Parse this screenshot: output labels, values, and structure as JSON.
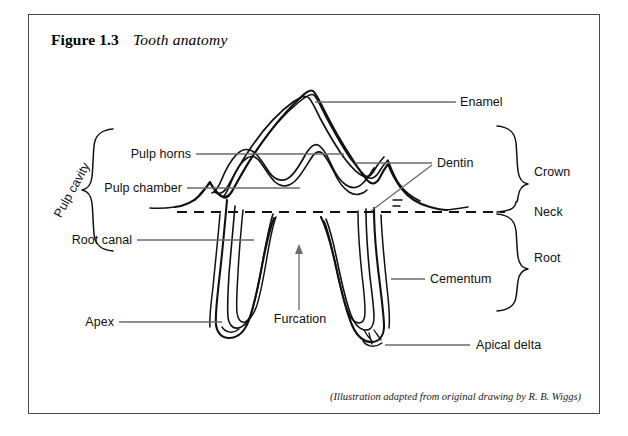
{
  "figure": {
    "number": "Figure 1.3",
    "caption": "Tooth anatomy",
    "source_note": "(Illustration adapted from original drawing by R. B. Wiggs)"
  },
  "labels": {
    "enamel": "Enamel",
    "dentin": "Dentin",
    "crown": "Crown",
    "neck": "Neck",
    "root": "Root",
    "cementum": "Cementum",
    "apical_delta": "Apical delta",
    "pulp_horns": "Pulp horns",
    "pulp_chamber": "Pulp chamber",
    "root_canal": "Root canal",
    "apex": "Apex",
    "furcation": "Furcation",
    "pulp_cavity": "Pulp cavity"
  },
  "colors": {
    "ink": "#111111",
    "leader": "#6b6b6b",
    "border": "#4a4a4a",
    "background": "#ffffff"
  }
}
